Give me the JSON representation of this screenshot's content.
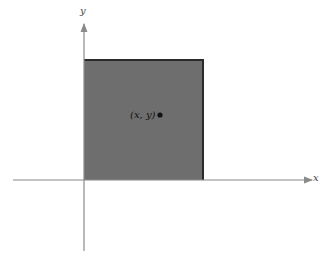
{
  "diagram": {
    "x_axis_label": "x",
    "y_axis_label": "y",
    "point_label": "(x, y)",
    "colors": {
      "square_fill": "#6e6e6e",
      "square_edge": "#2a2a2a",
      "axis": "#8a8a8a",
      "point": "#111111"
    }
  }
}
